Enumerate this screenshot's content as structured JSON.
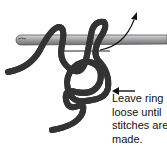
{
  "diagram": {
    "annotation": {
      "lines": [
        "Leave ring",
        "loose until",
        "stitches are",
        "made."
      ]
    },
    "colors": {
      "hook": "#a9a9ab",
      "yarn_fill": "#e6e6e6",
      "yarn_outline": "#333333",
      "arrow": "#111111"
    }
  }
}
